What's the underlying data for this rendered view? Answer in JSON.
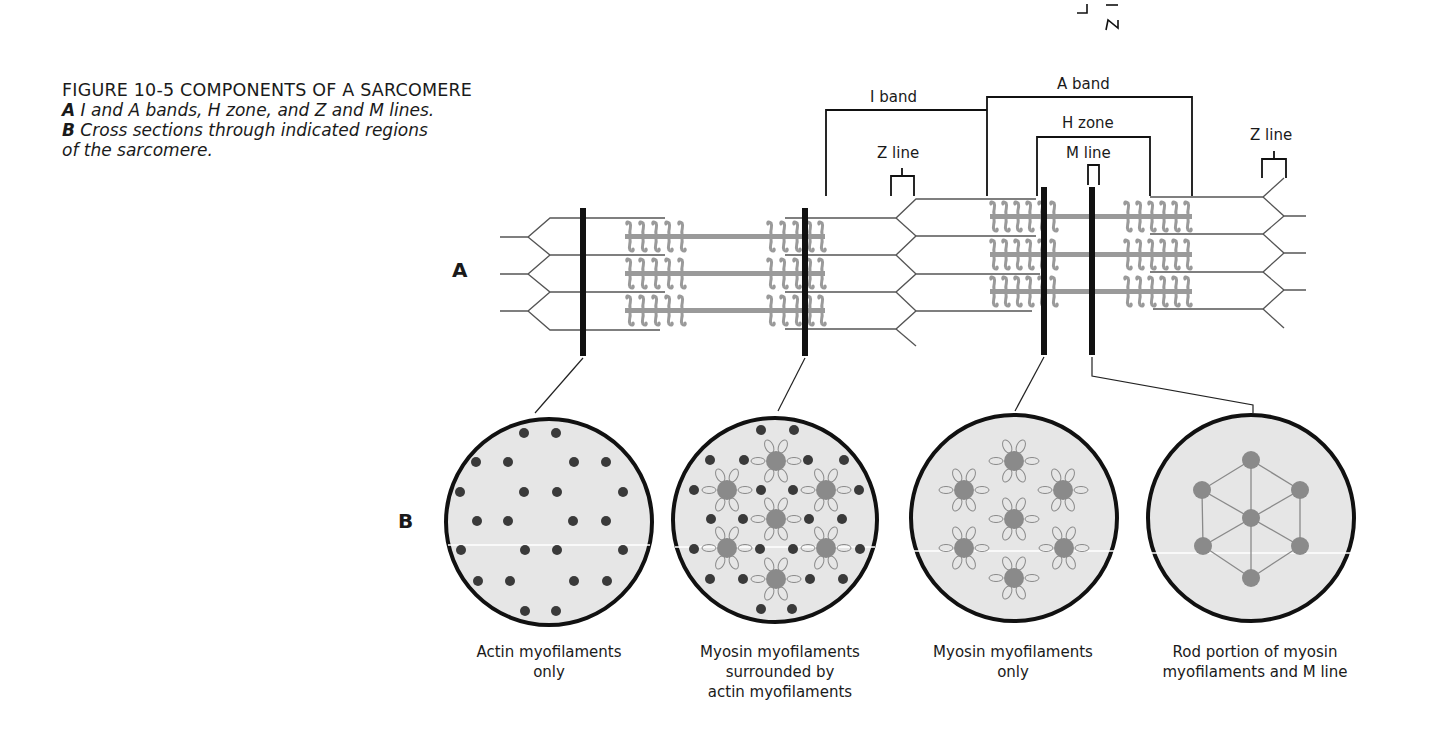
{
  "caption": {
    "title": "FIGURE 10-5 COMPONENTS OF A SARCOMERE",
    "line_a_lead": "A",
    "line_a_text": " I and A bands, H zone, and Z and M lines.",
    "line_b_lead": "B",
    "line_b_text": " Cross sections through indicated regions",
    "line_b2_text": "of the sarcomere."
  },
  "corner_marks": {
    "left": "┐",
    "right": "S"
  },
  "panel_labels": {
    "a": "A",
    "b": "B"
  },
  "longitudinal_labels": {
    "i_band": "I band",
    "a_band": "A band",
    "h_zone": "H zone",
    "m_line": "M line",
    "z_line_left": "Z line",
    "z_line_right": "Z line"
  },
  "cross_sections": [
    {
      "id": "actin-only",
      "label_lines": [
        "Actin myofilaments",
        "only"
      ]
    },
    {
      "id": "myosin-and-actin",
      "label_lines": [
        "Myosin myofilaments",
        "surrounded by",
        "actin myofilaments"
      ]
    },
    {
      "id": "myosin-only",
      "label_lines": [
        "Myosin myofilaments",
        "only"
      ]
    },
    {
      "id": "m-line",
      "label_lines": [
        "Rod portion of myosin",
        "myofilaments and M line"
      ]
    }
  ],
  "colors": {
    "ink": "#111111",
    "filament_gray": "#9a9a9a",
    "myosin_dot": "#8a8a8a",
    "actin_dot": "#3a3a3a",
    "cross_section_fill": "#e6e6e6",
    "line_gray": "#555555"
  }
}
